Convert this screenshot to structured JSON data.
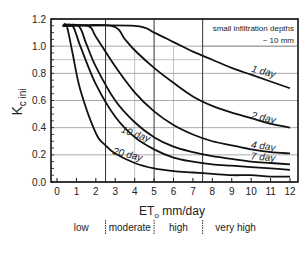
{
  "chart_data": {
    "type": "line",
    "title": "",
    "xlabel": "ET",
    "xlabel_sub": "o",
    "xlabel_unit": " mm/day",
    "ylabel": "K",
    "ylabel_sub": "c ini",
    "xlim": [
      0,
      12
    ],
    "ylim": [
      0.0,
      1.2
    ],
    "x_ticks": [
      0,
      1,
      2,
      3,
      4,
      5,
      6,
      7,
      8,
      9,
      10,
      11,
      12
    ],
    "y_ticks": [
      "0.0",
      "0.2",
      "0.4",
      "0.6",
      "0.8",
      "1.0",
      "1.2"
    ],
    "grid": true,
    "annotation": [
      "small infiltration depths",
      "~ 10 mm"
    ],
    "categories_band": [
      {
        "label": "low",
        "from": 0,
        "to": 2.5
      },
      {
        "label": "moderate",
        "from": 2.5,
        "to": 5
      },
      {
        "label": "high",
        "from": 5,
        "to": 7.5
      },
      {
        "label": "very high",
        "from": 7.5,
        "to": 12
      }
    ],
    "band_dividers": [
      2.5,
      5,
      7.5
    ],
    "series": [
      {
        "name": "1 day",
        "x": [
          0.3,
          4,
          5,
          6,
          7,
          8,
          9,
          10,
          11,
          12
        ],
        "y": [
          1.15,
          1.15,
          1.1,
          1.03,
          0.96,
          0.9,
          0.84,
          0.79,
          0.74,
          0.69
        ]
      },
      {
        "name": "2 day",
        "x": [
          0.3,
          2.8,
          3.5,
          4,
          5,
          6,
          7,
          8,
          9,
          10,
          11,
          12
        ],
        "y": [
          1.15,
          1.15,
          1.05,
          0.97,
          0.84,
          0.73,
          0.63,
          0.56,
          0.51,
          0.47,
          0.43,
          0.4
        ]
      },
      {
        "name": "4 day",
        "x": [
          0.3,
          1.6,
          2,
          3,
          4,
          5,
          6,
          7,
          8,
          9,
          10,
          11,
          12
        ],
        "y": [
          1.15,
          1.15,
          1.07,
          0.85,
          0.66,
          0.52,
          0.42,
          0.35,
          0.3,
          0.27,
          0.24,
          0.22,
          0.21
        ]
      },
      {
        "name": "7 day",
        "x": [
          0.3,
          1.1,
          1.5,
          2,
          3,
          4,
          5,
          6,
          7,
          8,
          9,
          10,
          11,
          12
        ],
        "y": [
          1.15,
          1.15,
          1.02,
          0.85,
          0.6,
          0.44,
          0.33,
          0.26,
          0.22,
          0.19,
          0.17,
          0.15,
          0.14,
          0.13
        ]
      },
      {
        "name": "10 day",
        "x": [
          0.3,
          0.8,
          1.2,
          2,
          3,
          4,
          5,
          6,
          7,
          8,
          9,
          10,
          11,
          12
        ],
        "y": [
          1.15,
          1.15,
          1.0,
          0.72,
          0.48,
          0.33,
          0.24,
          0.18,
          0.15,
          0.13,
          0.12,
          0.11,
          0.1,
          0.09
        ]
      },
      {
        "name": "20 day",
        "x": [
          0.3,
          0.5,
          0.8,
          1.2,
          2,
          2.5,
          3,
          4,
          5,
          6,
          7,
          8,
          9,
          10,
          11,
          12
        ],
        "y": [
          1.15,
          1.15,
          0.95,
          0.68,
          0.36,
          0.27,
          0.21,
          0.14,
          0.1,
          0.08,
          0.07,
          0.06,
          0.05,
          0.05,
          0.04,
          0.04
        ]
      }
    ],
    "series_labels": [
      {
        "name": "1 day",
        "x": 10.6,
        "y": 0.79,
        "angle": 14
      },
      {
        "name": "2 day",
        "x": 10.6,
        "y": 0.45,
        "angle": 12
      },
      {
        "name": "4 day",
        "x": 10.6,
        "y": 0.24,
        "angle": 8
      },
      {
        "name": "7 day",
        "x": 10.6,
        "y": 0.16,
        "angle": 5
      },
      {
        "name": "10 day",
        "x": 4.0,
        "y": 0.33,
        "angle": 20
      },
      {
        "name": "20 day",
        "x": 3.6,
        "y": 0.18,
        "angle": 14
      }
    ]
  }
}
